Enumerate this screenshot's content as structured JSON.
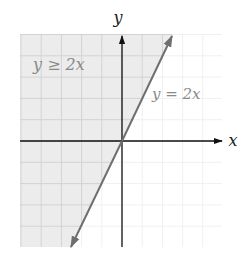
{
  "figure": {
    "type": "inequality-graph",
    "x_axis_label": "x",
    "y_axis_label": "y",
    "inequality_label": "y ≥ 2x",
    "boundary_label": "y = 2x",
    "grid": {
      "xmin": -5,
      "xmax": 5,
      "ymin": -5,
      "ymax": 5,
      "step": 1
    },
    "boundary_line": {
      "slope": 2,
      "intercept": 0,
      "style": "solid"
    },
    "shaded_region": "above-left of line (y >= 2x)",
    "colors": {
      "shade": "#ececec",
      "grid_shaded": "#d2d2d2",
      "grid_unshaded": "#f0f0f0",
      "line": "#6e6e6e",
      "axes": "#111111",
      "labels": "#8a8a8a"
    }
  },
  "chart_data": {
    "type": "line",
    "title": "",
    "xlabel": "x",
    "ylabel": "y",
    "xlim": [
      -5,
      5
    ],
    "ylim": [
      -5,
      5
    ],
    "grid": true,
    "series": [
      {
        "name": "y = 2x",
        "x": [
          -2.5,
          0,
          2.5
        ],
        "y": [
          -5,
          0,
          5
        ]
      }
    ],
    "annotations": [
      "y ≥ 2x",
      "y = 2x"
    ],
    "shading": "region y ≥ 2x"
  }
}
